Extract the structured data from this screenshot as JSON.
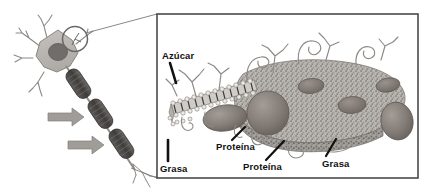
{
  "figure": {
    "background_color": "#ffffff",
    "frame_border_color": "#4a4a4a"
  },
  "neuron": {
    "name": "neuron-diagram",
    "soma_color": "#b9b6b1",
    "nucleus_color": "#6e6b68",
    "axon_segment_color": "#4d4b49",
    "arrow_color": "#9a9893",
    "myelin_segment_count": 3,
    "arrow_count": 2,
    "dendrite_count": 5,
    "highlight_circle": {
      "name": "membrane-highlight-circle",
      "color": "#6a6866"
    }
  },
  "magnification": {
    "name": "magnification-leader-lines",
    "line_color": "#7d7b78",
    "line_count": 2
  },
  "membrane": {
    "name": "cell-membrane-illustration",
    "surface_color": "#b5b2ad",
    "protein_color": "#8a837e",
    "bilayer_head_color": "#d8d5d0",
    "protein_bumps": 5,
    "glycoprotein_chains": 9
  },
  "labels": {
    "azucar": "Azúcar",
    "grasa_left": "Grasa",
    "proteina_1": "Proteína",
    "proteina_2": "Proteína",
    "grasa_right": "Grasa"
  }
}
